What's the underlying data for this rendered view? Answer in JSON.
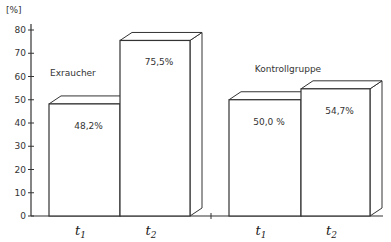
{
  "chart_data": {
    "type": "bar",
    "title": "",
    "xlabel": "",
    "ylabel": "[%]",
    "ylim": [
      0,
      80
    ],
    "yticks": [
      0,
      10,
      20,
      30,
      40,
      50,
      60,
      70,
      80
    ],
    "grid": false,
    "bar_style": "3d",
    "groups": [
      {
        "name": "Exraucher",
        "categories": [
          {
            "label": "t",
            "sub": "1",
            "value": 48.2,
            "value_label": "48,2%"
          },
          {
            "label": "t",
            "sub": "2",
            "value": 75.5,
            "value_label": "75,5%"
          }
        ]
      },
      {
        "name": "Kontrollgruppe",
        "categories": [
          {
            "label": "t",
            "sub": "1",
            "value": 50.0,
            "value_label": "50,0 %"
          },
          {
            "label": "t",
            "sub": "2",
            "value": 54.7,
            "value_label": "54,7%"
          }
        ]
      }
    ]
  },
  "colors": {
    "line": "#333333",
    "fill": "#ffffff"
  }
}
